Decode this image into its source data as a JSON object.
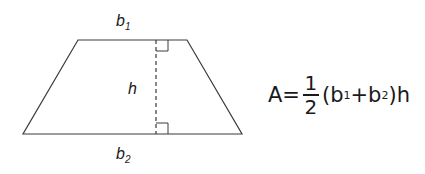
{
  "diagram": {
    "shape": "trapezoid",
    "labels": {
      "top_base": "b",
      "top_base_sub": "1",
      "bottom_base": "b",
      "bottom_base_sub": "2",
      "height": "h"
    },
    "formula": {
      "lhs": "A=",
      "numerator": "1",
      "denominator": "2",
      "open": "(b",
      "sub1": "1",
      "plus": "+b",
      "sub2": "2",
      "close": ")h"
    },
    "colors": {
      "stroke": "#3a3a3a",
      "text": "#1a1a1a",
      "background": "#ffffff"
    }
  }
}
